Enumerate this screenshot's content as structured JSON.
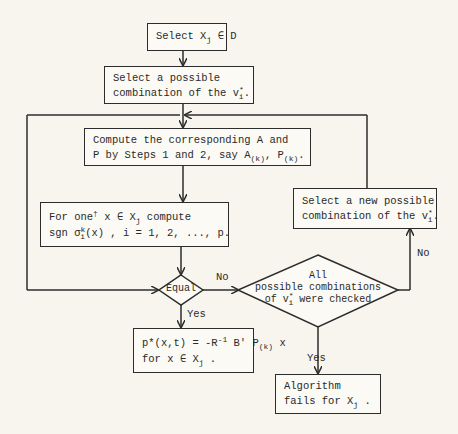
{
  "nodes": {
    "select_xj": {
      "text": "Select X",
      "sub": "j",
      "suffix": " ∈ D"
    },
    "select_combination": {
      "line1": "Select a possible",
      "line2": "combination of the v",
      "sup": "*",
      "sub": "i",
      "end": "."
    },
    "compute_ap": {
      "line1": "Compute the corresponding A and",
      "line2a": "P by Steps 1 and 2, say A",
      "sub1": "(k)",
      "mid": ", P",
      "sub2": "(k)",
      "end": "."
    },
    "for_one_x": {
      "l1a": "For one",
      "dagger": "†",
      "l1b": " x ∈ X",
      "l1sub": "j",
      "l1c": "  compute",
      "l2a": "sgn σ",
      "l2sup": "k",
      "l2sub": "i",
      "l2b": "(x) , i = 1, 2, ..., p."
    },
    "equal": {
      "text": "Equal"
    },
    "all_checked": {
      "line1": "All",
      "line2": "possible combinations",
      "line3a": "of v",
      "sup": "*",
      "sub": "i",
      "line3b": " were checked"
    },
    "select_new": {
      "line1": "Select a new possible",
      "line2": "combination of the v",
      "sup": "*",
      "sub": "i",
      "end": "."
    },
    "result": {
      "l1a": "p*(x,t) = -R",
      "sup": "-1",
      "l1b": " B' P",
      "sub": "(k)",
      "l1c": " x",
      "l2a": "for  x ∈ X",
      "l2sub": "j",
      "l2b": " ."
    },
    "fails": {
      "line1": "Algorithm",
      "line2a": "fails for  X",
      "sub": "j",
      "line2b": " ."
    }
  },
  "edge_labels": {
    "equal_no": "No",
    "equal_yes": "Yes",
    "checked_no": "No",
    "checked_yes": "Yes"
  }
}
